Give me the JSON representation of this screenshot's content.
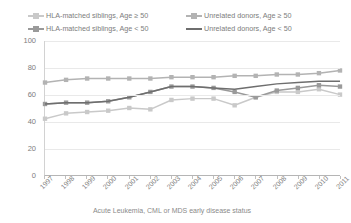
{
  "chart_data": {
    "type": "line",
    "title": "",
    "xlabel": "Acute Leukemia, CML or MDS early disease status",
    "ylabel": "",
    "categories": [
      "1997",
      "1998",
      "1999",
      "2000",
      "2001",
      "2002",
      "2003",
      "2004",
      "2005",
      "2006",
      "2007",
      "2008",
      "2009",
      "2010",
      "2011"
    ],
    "ylim": [
      0,
      100
    ],
    "yticks": [
      0,
      20,
      40,
      60,
      80,
      100
    ],
    "grid": true,
    "legend_position": "top",
    "series": [
      {
        "name": "HLA-matched siblings, Age ≥ 50",
        "color": "#c9c9c9",
        "marker": "square",
        "values": [
          42,
          46,
          47,
          48,
          50,
          49,
          56,
          57,
          57,
          52,
          58,
          62,
          62,
          64,
          60
        ]
      },
      {
        "name": "HLA-matched siblings, Age < 50",
        "color": "#9a9a9a",
        "marker": "square",
        "values": [
          53,
          54,
          54,
          55,
          58,
          62,
          66,
          66,
          65,
          62,
          58,
          63,
          65,
          67,
          66
        ]
      },
      {
        "name": "Unrelated donors, Age ≥ 50",
        "color": "#b3b3b3",
        "marker": "square",
        "values": [
          69,
          71,
          72,
          72,
          72,
          72,
          73,
          73,
          73,
          74,
          74,
          75,
          75,
          76,
          78
        ]
      },
      {
        "name": "Unrelated donors, Age < 50",
        "color": "#6e6e6e",
        "marker": "none",
        "values": [
          53,
          54,
          54,
          55,
          58,
          62,
          66,
          66,
          65,
          64,
          66,
          68,
          69,
          70,
          70
        ]
      }
    ]
  },
  "legend": {
    "items": [
      {
        "label": "HLA-matched siblings, Age ≥ 50",
        "color": "#c9c9c9",
        "marker": "square"
      },
      {
        "label": "Unrelated donors, Age ≥ 50",
        "color": "#b3b3b3",
        "marker": "square"
      },
      {
        "label": "HLA-matched siblings, Age < 50",
        "color": "#9a9a9a",
        "marker": "square"
      },
      {
        "label": "Unrelated donors, Age < 50",
        "color": "#6e6e6e",
        "marker": "none"
      }
    ]
  },
  "axis": {
    "x_title": "Acute Leukemia, CML or MDS early disease status",
    "y_ticks": [
      "100",
      "80",
      "60",
      "40",
      "20",
      "0"
    ]
  }
}
